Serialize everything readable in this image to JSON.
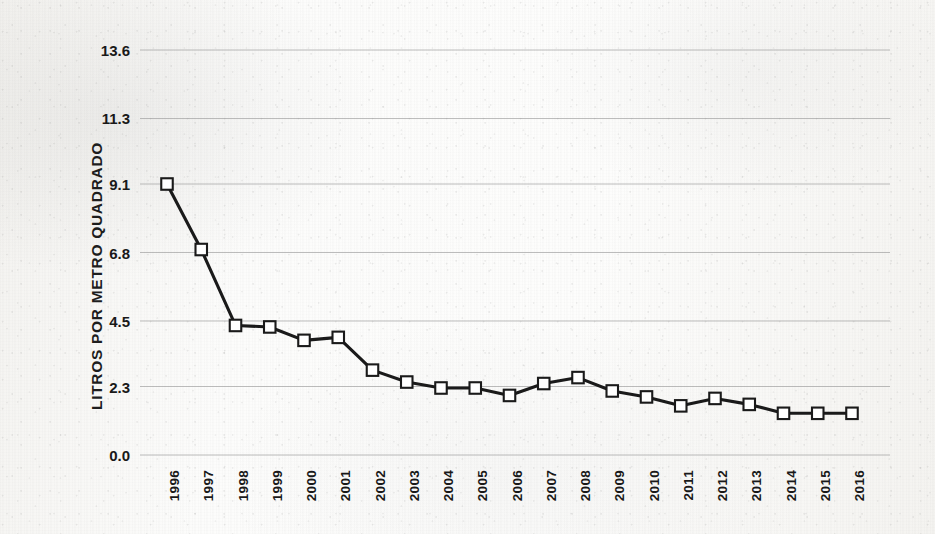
{
  "chart_data": {
    "type": "line",
    "title": "",
    "subtitle": "",
    "xlabel": "",
    "ylabel": "LITROS POR METRO QUADRADO",
    "categories": [
      "1996",
      "1997",
      "1998",
      "1999",
      "2000",
      "2001",
      "2002",
      "2003",
      "2004",
      "2005",
      "2006",
      "2007",
      "2008",
      "2009",
      "2010",
      "2011",
      "2012",
      "2013",
      "2014",
      "2015",
      "2016"
    ],
    "values": [
      9.1,
      6.9,
      4.35,
      4.3,
      3.85,
      3.95,
      2.85,
      2.45,
      2.25,
      2.25,
      2.0,
      2.4,
      2.6,
      2.15,
      1.95,
      1.65,
      1.9,
      1.7,
      1.4,
      1.4,
      1.4
    ],
    "series": [
      {
        "name": "Litros por metro quadrado",
        "values": [
          9.1,
          6.9,
          4.35,
          4.3,
          3.85,
          3.95,
          2.85,
          2.45,
          2.25,
          2.25,
          2.0,
          2.4,
          2.6,
          2.15,
          1.95,
          1.65,
          1.9,
          1.7,
          1.4,
          1.4,
          1.4
        ]
      }
    ],
    "ytick_labels": [
      "13.6",
      "11.3",
      "9.1",
      "6.8",
      "4.5",
      "2.3",
      "0.0"
    ],
    "ytick_values": [
      13.6,
      11.3,
      9.1,
      6.8,
      4.5,
      2.3,
      0.0
    ],
    "ylim": [
      0.0,
      13.6
    ],
    "grid": true,
    "grid_axis": "y",
    "legend": false,
    "legend_position": "none",
    "marker": "square-open",
    "line_color": "#1a1a1a",
    "marker_fill": "#ffffff",
    "marker_edge": "#1a1a1a",
    "grid_color": "#9a9a9a",
    "background_color": "#fbfbf9",
    "text_color": "#191919"
  },
  "axis": {
    "y_title": "LITROS POR METRO QUADRADO"
  }
}
